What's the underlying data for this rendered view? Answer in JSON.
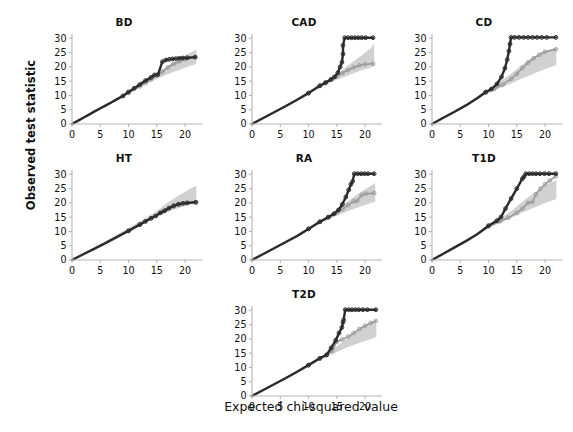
{
  "figure": {
    "ylabel": "Observed test statistic",
    "xlabel": "Expected chi-squared value",
    "layout": "3 columns x 2 rows plus 1 centered bottom panel",
    "colors": {
      "dark_series": "#2b2b2b",
      "light_series": "#9a9a9a",
      "confidence_band": "#c9c9c9",
      "axis": "#b5b5b5",
      "text": "#111111",
      "background": "#ffffff"
    }
  },
  "axes": {
    "x_ticks": [
      "0",
      "5",
      "10",
      "15",
      "20"
    ],
    "y_ticks": [
      "0",
      "5",
      "10",
      "15",
      "20",
      "25",
      "30"
    ],
    "xlim": [
      0,
      23
    ],
    "ylim": [
      0,
      31.5
    ]
  },
  "chart_data": [
    {
      "type": "scatter",
      "title": "BD",
      "xlabel": "Expected chi-squared value",
      "ylabel": "Observed test statistic",
      "xlim": [
        0,
        23
      ],
      "ylim": [
        0,
        31.5
      ],
      "grid": false,
      "legend": "none",
      "series": [
        {
          "name": "dark",
          "x": [
            0,
            1,
            2,
            3,
            4,
            5,
            6,
            7,
            8,
            9,
            10,
            11,
            12,
            13,
            14,
            14.6,
            15.2,
            16,
            16.6,
            17.2,
            17.8,
            18.4,
            19,
            19.6,
            20.4,
            21.8
          ],
          "values": [
            0,
            1.1,
            2.2,
            3.3,
            4.4,
            5.5,
            6.5,
            7.6,
            8.7,
            9.8,
            11.2,
            12.5,
            13.8,
            15.2,
            16.3,
            17.2,
            17.3,
            21.8,
            22.4,
            22.6,
            22.8,
            22.9,
            23,
            23.1,
            23.2,
            23.4
          ]
        },
        {
          "name": "light",
          "x": [
            0,
            2,
            4,
            6,
            8,
            10,
            12,
            13,
            14,
            15,
            16,
            17,
            18,
            19,
            20,
            21.8
          ],
          "values": [
            0,
            2.2,
            4.3,
            6.4,
            8.6,
            10.9,
            13.2,
            14.4,
            15.6,
            16.9,
            18.3,
            19.8,
            21.0,
            21.9,
            22.6,
            23.4
          ]
        }
      ],
      "band": {
        "x": [
          0,
          6,
          10,
          13,
          15,
          17,
          19,
          21,
          22
        ],
        "lower": [
          0,
          6.3,
          10.6,
          13.8,
          15.8,
          17.5,
          19.0,
          20.4,
          21.0
        ],
        "upper": [
          0,
          6.8,
          11.5,
          15.0,
          17.5,
          20.5,
          23.0,
          25.0,
          26.0
        ]
      }
    },
    {
      "type": "scatter",
      "title": "CAD",
      "xlabel": "Expected chi-squared value",
      "ylabel": "Observed test statistic",
      "xlim": [
        0,
        23
      ],
      "ylim": [
        0,
        31.5
      ],
      "grid": false,
      "legend": "none",
      "series": [
        {
          "name": "dark",
          "x": [
            0,
            2,
            4,
            6,
            8,
            10,
            12,
            13,
            14,
            14.6,
            15.2,
            15.6,
            15.9,
            16.1,
            16.1,
            16.4,
            17,
            17.6,
            18.2,
            18.8,
            19.4,
            20.1,
            21.4
          ],
          "values": [
            0,
            2.1,
            4.2,
            6.3,
            8.5,
            10.8,
            13.4,
            14.5,
            15.6,
            16.5,
            18.0,
            20.0,
            21.6,
            24.5,
            27.5,
            30.2,
            30.2,
            30.2,
            30.2,
            30.2,
            30.2,
            30.2,
            30.2
          ]
        },
        {
          "name": "light",
          "x": [
            0,
            2,
            4,
            6,
            8,
            10,
            12,
            13,
            14,
            15,
            16,
            17,
            18,
            19,
            20,
            21.4
          ],
          "values": [
            0,
            2.1,
            4.2,
            6.3,
            8.5,
            10.8,
            13.3,
            14.4,
            15.5,
            16.6,
            17.8,
            18.9,
            19.8,
            20.5,
            20.9,
            21.1
          ]
        }
      ],
      "band": {
        "x": [
          0,
          6,
          10,
          13,
          15,
          17,
          19,
          21,
          21.6
        ],
        "lower": [
          0,
          6.2,
          10.5,
          13.6,
          15.5,
          17.0,
          18.5,
          19.8,
          20.3
        ],
        "upper": [
          0,
          6.7,
          11.3,
          14.8,
          17.3,
          20.5,
          23.5,
          26.5,
          28.0
        ]
      }
    },
    {
      "type": "scatter",
      "title": "CD",
      "xlabel": "Expected chi-squared value",
      "ylabel": "Observed test statistic",
      "xlim": [
        0,
        23
      ],
      "ylim": [
        0,
        31.5
      ],
      "grid": false,
      "legend": "none",
      "series": [
        {
          "name": "dark",
          "x": [
            0,
            2,
            4,
            6,
            8,
            9.5,
            10.5,
            11.5,
            12.3,
            12.9,
            13.3,
            13.6,
            13.8,
            14.0,
            14.6,
            15.4,
            16.2,
            17,
            17.8,
            18.6,
            19.4,
            20.3,
            21.9
          ],
          "values": [
            0,
            2.2,
            4.3,
            6.5,
            9.0,
            11.2,
            12.2,
            14.0,
            16.5,
            19.5,
            22.5,
            25.5,
            28.0,
            30.3,
            30.3,
            30.3,
            30.3,
            30.3,
            30.3,
            30.3,
            30.3,
            30.3,
            30.3
          ]
        },
        {
          "name": "light",
          "x": [
            0,
            2,
            4,
            6,
            8,
            9.5,
            11,
            12.5,
            14,
            15,
            16,
            17,
            18,
            19,
            20,
            21.9
          ],
          "values": [
            0,
            2.2,
            4.3,
            6.5,
            9.0,
            11.0,
            12.3,
            13.8,
            15.8,
            17.5,
            19.6,
            21.5,
            23.0,
            24.3,
            25.3,
            26.1
          ]
        }
      ],
      "band": {
        "x": [
          0,
          6,
          9.5,
          12,
          14,
          16,
          18,
          20,
          22
        ],
        "lower": [
          0,
          6.4,
          10.3,
          12.5,
          14.2,
          16.0,
          17.6,
          19.2,
          20.6
        ],
        "upper": [
          0,
          6.9,
          11.6,
          14.8,
          17.6,
          20.8,
          23.6,
          25.6,
          26.8
        ]
      }
    },
    {
      "type": "scatter",
      "title": "HT",
      "xlabel": "Expected chi-squared value",
      "ylabel": "Observed test statistic",
      "xlim": [
        0,
        23
      ],
      "ylim": [
        0,
        31.5
      ],
      "grid": false,
      "legend": "none",
      "series": [
        {
          "name": "dark",
          "x": [
            0,
            2,
            4,
            6,
            8,
            10,
            12,
            13,
            14,
            14.8,
            15.6,
            16.4,
            17.2,
            18,
            18.8,
            19.6,
            20.4,
            21.9
          ],
          "values": [
            0,
            2.0,
            4.0,
            6.0,
            8.1,
            10.2,
            12.4,
            13.5,
            14.6,
            15.4,
            16.5,
            17.3,
            18.2,
            19.0,
            19.5,
            19.8,
            20.0,
            20.2
          ]
        },
        {
          "name": "light",
          "x": [
            0,
            2,
            4,
            6,
            8,
            10,
            12,
            14,
            16,
            17,
            18,
            19,
            20,
            21.9
          ],
          "values": [
            0,
            2.0,
            4.0,
            6.0,
            8.1,
            10.2,
            12.4,
            14.6,
            16.8,
            17.8,
            18.7,
            19.4,
            19.9,
            20.2
          ]
        }
      ],
      "band": {
        "x": [
          0,
          6,
          10,
          13,
          15,
          17,
          19,
          21,
          22
        ],
        "lower": [
          0,
          6.1,
          10.3,
          13.3,
          15.2,
          16.9,
          18.3,
          19.4,
          20.0
        ],
        "upper": [
          0,
          6.6,
          11.2,
          14.7,
          17.2,
          20.2,
          22.8,
          25.0,
          26.0
        ]
      }
    },
    {
      "type": "scatter",
      "title": "RA",
      "xlabel": "Expected chi-squared value",
      "ylabel": "Observed test statistic",
      "xlim": [
        0,
        23
      ],
      "ylim": [
        0,
        31.5
      ],
      "grid": false,
      "legend": "none",
      "series": [
        {
          "name": "dark",
          "x": [
            0,
            2,
            4,
            6,
            8,
            10,
            12,
            13.5,
            14.5,
            15.3,
            16,
            16.6,
            17.1,
            17.5,
            17.8,
            18.1,
            18.7,
            19.3,
            19.9,
            20.5,
            21.6
          ],
          "values": [
            0,
            2.1,
            4.2,
            6.3,
            8.4,
            10.9,
            13.4,
            15.0,
            16.2,
            17.5,
            19.5,
            22.0,
            24.5,
            26.5,
            27.5,
            30.2,
            30.2,
            30.2,
            30.2,
            30.2,
            30.2
          ]
        },
        {
          "name": "light",
          "x": [
            0,
            2,
            4,
            6,
            8,
            10,
            12,
            13.5,
            15,
            16,
            17,
            18,
            18.6,
            19.4,
            20.2,
            21.6
          ],
          "values": [
            0,
            2.1,
            4.2,
            6.3,
            8.4,
            10.9,
            13.3,
            14.9,
            16.6,
            17.8,
            19.2,
            20.5,
            20.6,
            22.8,
            23.2,
            23.4
          ]
        }
      ],
      "band": {
        "x": [
          0,
          6,
          10,
          13,
          15,
          17,
          19,
          21,
          21.8
        ],
        "lower": [
          0,
          6.3,
          10.6,
          13.6,
          15.5,
          17.2,
          18.6,
          19.9,
          20.4
        ],
        "upper": [
          0,
          6.8,
          11.4,
          14.9,
          17.5,
          20.6,
          23.4,
          26.0,
          27.0
        ]
      }
    },
    {
      "type": "scatter",
      "title": "T1D",
      "xlabel": "Expected chi-squared value",
      "ylabel": "Observed test statistic",
      "xlim": [
        0,
        23
      ],
      "ylim": [
        0,
        31.5
      ],
      "grid": false,
      "legend": "none",
      "series": [
        {
          "name": "dark",
          "x": [
            0,
            2,
            4,
            6,
            8,
            10,
            11.5,
            12.2,
            13,
            14,
            15,
            16,
            16.3,
            16.6,
            17.2,
            17.8,
            18.4,
            19.1,
            19.9,
            20.7,
            21.9
          ],
          "values": [
            0,
            2.2,
            4.4,
            6.6,
            9.0,
            12.0,
            13.8,
            15.0,
            18.0,
            21.5,
            25.0,
            28.5,
            29.2,
            30.2,
            30.2,
            30.2,
            30.2,
            30.2,
            30.2,
            30.2,
            30.2
          ]
        },
        {
          "name": "light",
          "x": [
            0,
            2,
            4,
            6,
            8,
            10,
            12,
            13.5,
            15,
            16,
            17,
            17.8,
            18.4,
            19.2,
            20,
            20.8,
            21.9
          ],
          "values": [
            0,
            2.2,
            4.4,
            6.6,
            9.0,
            11.8,
            13.5,
            14.8,
            16.5,
            18.0,
            20.0,
            20.3,
            23.0,
            25.0,
            26.5,
            27.8,
            29.3
          ]
        }
      ],
      "band": {
        "x": [
          0,
          6,
          10,
          12,
          14,
          16,
          18,
          20,
          22
        ],
        "lower": [
          0,
          6.5,
          11.0,
          13.0,
          14.8,
          16.6,
          18.3,
          19.9,
          21.3
        ],
        "upper": [
          0,
          7.0,
          11.9,
          14.5,
          17.2,
          20.4,
          23.4,
          26.0,
          28.0
        ]
      }
    },
    {
      "type": "scatter",
      "title": "T2D",
      "xlabel": "Expected chi-squared value",
      "ylabel": "Observed test statistic",
      "xlim": [
        0,
        23
      ],
      "ylim": [
        0,
        31.5
      ],
      "grid": false,
      "legend": "none",
      "series": [
        {
          "name": "dark",
          "x": [
            0,
            2,
            4,
            6,
            8,
            10,
            12,
            13.2,
            14,
            14.8,
            15.4,
            15.9,
            16.1,
            16.2,
            16.5,
            17.1,
            17.7,
            18.3,
            18.9,
            19.6,
            20.4,
            21.9
          ],
          "values": [
            0,
            2.1,
            4.2,
            6.3,
            8.5,
            10.8,
            13.2,
            14.4,
            16.8,
            19.5,
            22.0,
            24.0,
            25.8,
            26.6,
            30.2,
            30.2,
            30.2,
            30.2,
            30.2,
            30.2,
            30.2,
            30.2
          ]
        },
        {
          "name": "light",
          "x": [
            0,
            2,
            4,
            6,
            8,
            10,
            12,
            13.2,
            14.2,
            15,
            16,
            17,
            18,
            19,
            20,
            21,
            21.9
          ],
          "values": [
            0,
            2.1,
            4.2,
            6.3,
            8.5,
            10.8,
            13.1,
            14.3,
            15.8,
            19.0,
            19.8,
            20.8,
            22.0,
            23.4,
            24.6,
            25.6,
            26.3
          ]
        }
      ],
      "band": {
        "x": [
          0,
          6,
          10,
          13,
          15,
          17,
          19,
          21,
          22
        ],
        "lower": [
          0,
          6.2,
          10.5,
          13.5,
          15.4,
          17.1,
          18.6,
          20.0,
          20.7
        ],
        "upper": [
          0,
          6.7,
          11.4,
          14.9,
          17.4,
          20.5,
          23.3,
          25.6,
          26.7
        ]
      }
    }
  ]
}
